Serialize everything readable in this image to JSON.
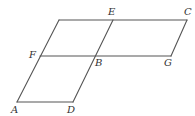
{
  "diagram": {
    "type": "geometry-figure",
    "points": {
      "TL": {
        "x": 59,
        "y": 20
      },
      "E": {
        "x": 113,
        "y": 20
      },
      "C": {
        "x": 187,
        "y": 20
      },
      "F": {
        "x": 40,
        "y": 56
      },
      "B": {
        "x": 96,
        "y": 56
      },
      "G": {
        "x": 171,
        "y": 56
      },
      "A": {
        "x": 17,
        "y": 102
      },
      "D": {
        "x": 73,
        "y": 102
      }
    },
    "segments": [
      {
        "name": "top-edge",
        "from": "TL",
        "to": "C"
      },
      {
        "name": "middle-edge-FG",
        "from": "F",
        "to": "G"
      },
      {
        "name": "bottom-edge-AD",
        "from": "A",
        "to": "D"
      },
      {
        "name": "left-slant",
        "from": "TL",
        "to": "A"
      },
      {
        "name": "slant-ED",
        "from": "E",
        "to": "D"
      },
      {
        "name": "slant-CG",
        "from": "C",
        "to": "G"
      }
    ],
    "labels": {
      "E": {
        "text": "E",
        "x": 108,
        "y": 15
      },
      "C": {
        "text": "C",
        "x": 184,
        "y": 15
      },
      "F": {
        "text": "F",
        "x": 29,
        "y": 58
      },
      "B": {
        "text": "B",
        "x": 95,
        "y": 66
      },
      "G": {
        "text": "G",
        "x": 164,
        "y": 66
      },
      "A": {
        "text": "A",
        "x": 11,
        "y": 113
      },
      "D": {
        "text": "D",
        "x": 67,
        "y": 113
      }
    },
    "stroke_color": "#555555",
    "label_color": "#333333"
  }
}
